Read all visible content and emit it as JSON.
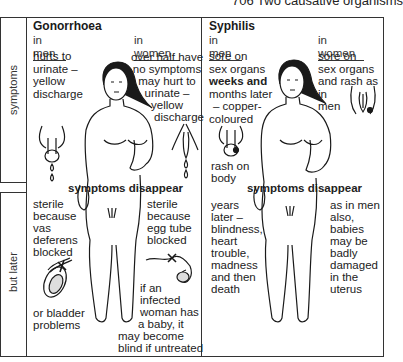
{
  "figure": {
    "title": "706  Two causative organisms"
  },
  "row_labels": [
    "symptoms",
    "but later"
  ],
  "gonorrhoea": {
    "name": "Gonorrhoea",
    "men": {
      "heading": "in men",
      "symptoms": [
        "hurts to",
        "urinate –",
        "yellow",
        "discharge"
      ],
      "later": [
        "sterile",
        "because",
        "vas",
        "deferens",
        "blocked"
      ],
      "later_extra": [
        "or bladder",
        "problems"
      ]
    },
    "women": {
      "heading": "in women",
      "symptoms": [
        "over half have",
        "no symptoms",
        "may hurt to",
        "urinate –",
        "yellow",
        "discharge"
      ],
      "later": [
        "sterile",
        "because",
        "egg tube",
        "blocked"
      ],
      "later_extra": [
        "if an",
        "infected",
        "woman has",
        "a baby, it",
        "may become",
        "blind if untreated"
      ]
    },
    "transition": "symptoms disappear"
  },
  "syphilis": {
    "name": "Syphilis",
    "men": {
      "heading": "in men",
      "symptoms_1": "sore on",
      "symptoms_2": "sex organs",
      "symptoms_3": "weeks and",
      "symptoms_4": "months later",
      "symptoms_5": "– copper-",
      "symptoms_6": "coloured",
      "symptoms_7": "rash on",
      "symptoms_8": "body",
      "later": [
        "years",
        "later –",
        "blindness,",
        "heart",
        "trouble,",
        "madness",
        "and then",
        "death"
      ]
    },
    "women": {
      "heading": "in women",
      "symptoms": [
        "sore on",
        "sex organs",
        "and rash as in",
        "men"
      ],
      "later": [
        "as in men",
        "also,",
        "babies",
        "may be",
        "badly",
        "damaged",
        "in the",
        "uterus"
      ]
    },
    "transition": "symptoms disappear"
  }
}
